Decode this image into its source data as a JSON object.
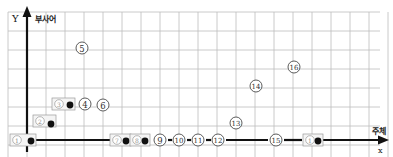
{
  "diagram": {
    "y_axis": {
      "letter": "Y",
      "label": "부사어"
    },
    "x_axis": {
      "letter": "X",
      "label": "주체"
    },
    "grid": {
      "x0": 8,
      "y0": 12,
      "step": 19,
      "cols": 20,
      "rows": 8
    },
    "origin": {
      "x": 27,
      "y": 140
    },
    "colors": {
      "grid": "#bdbdbd",
      "axis": "#111111",
      "marker_stroke": "#333333",
      "dot": "#111111"
    },
    "markers": [
      {
        "id": "1",
        "glyph": "①",
        "x": 17,
        "y": 140,
        "boxed": true,
        "dot": true,
        "dot_x": 31,
        "dot_y": 141
      },
      {
        "id": "2",
        "glyph": "②",
        "x": 40,
        "y": 121,
        "boxed": true,
        "dot": true,
        "dot_x": 51,
        "dot_y": 124
      },
      {
        "id": "3",
        "glyph": "③",
        "x": 59,
        "y": 104,
        "boxed": true,
        "dot": true,
        "dot_x": 70,
        "dot_y": 105
      },
      {
        "id": "4",
        "glyph": "④",
        "x": 85,
        "y": 104,
        "boxed": false,
        "dot": false
      },
      {
        "id": "5",
        "glyph": "⑤",
        "x": 82,
        "y": 48,
        "boxed": false,
        "dot": false
      },
      {
        "id": "6",
        "glyph": "⑥",
        "x": 103,
        "y": 105,
        "boxed": false,
        "dot": false
      },
      {
        "id": "7",
        "glyph": "⑦",
        "x": 117,
        "y": 140,
        "boxed": true,
        "dot": true,
        "dot_x": 126,
        "dot_y": 141
      },
      {
        "id": "8",
        "glyph": "⑧",
        "x": 137,
        "y": 140,
        "boxed": true,
        "dot": true,
        "dot_x": 145,
        "dot_y": 141
      },
      {
        "id": "9",
        "glyph": "⑨",
        "x": 160,
        "y": 140,
        "boxed": false,
        "dot": false
      },
      {
        "id": "10",
        "glyph": "⑩",
        "x": 179,
        "y": 140,
        "boxed": false,
        "dot": false
      },
      {
        "id": "11",
        "glyph": "⑪",
        "x": 198,
        "y": 140,
        "boxed": false,
        "dot": false
      },
      {
        "id": "12",
        "glyph": "⑫",
        "x": 218,
        "y": 140,
        "boxed": false,
        "dot": false
      },
      {
        "id": "13",
        "glyph": "⑬",
        "x": 236,
        "y": 123,
        "boxed": false,
        "dot": false
      },
      {
        "id": "14",
        "glyph": "⑭",
        "x": 256,
        "y": 86,
        "boxed": false,
        "dot": false
      },
      {
        "id": "15",
        "glyph": "⑮",
        "x": 276,
        "y": 140,
        "boxed": false,
        "dot": false
      },
      {
        "id": "16",
        "glyph": "⑯",
        "x": 294,
        "y": 67,
        "boxed": false,
        "dot": false
      },
      {
        "id": "17",
        "glyph": "①",
        "x": 310,
        "y": 140,
        "boxed": true,
        "dot": true,
        "dot_x": 318,
        "dot_y": 141
      }
    ],
    "segments": [
      {
        "x1": 27,
        "x2": 110,
        "y": 140
      },
      {
        "x1": 130,
        "x2": 136,
        "y": 140
      },
      {
        "x1": 168,
        "x2": 172,
        "y": 140
      },
      {
        "x1": 187,
        "x2": 191,
        "y": 140
      },
      {
        "x1": 206,
        "x2": 211,
        "y": 140
      },
      {
        "x1": 226,
        "x2": 268,
        "y": 140
      },
      {
        "x1": 284,
        "x2": 302,
        "y": 140
      },
      {
        "x1": 322,
        "x2": 380,
        "y": 140
      }
    ]
  }
}
